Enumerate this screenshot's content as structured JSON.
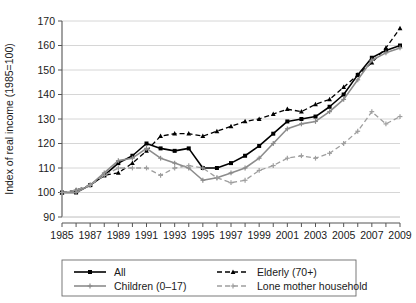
{
  "chart_data": {
    "type": "line",
    "title": "",
    "xlabel": "",
    "ylabel": "Index of real income (1985=100)",
    "xlim": [
      1985,
      2009
    ],
    "ylim": [
      90,
      170
    ],
    "ytick_step": 10,
    "xtick_step": 1,
    "xtick_label_step": 2,
    "grid": "horizontal",
    "legend_position": "bottom",
    "x": [
      1985,
      1986,
      1987,
      1988,
      1989,
      1990,
      1991,
      1992,
      1993,
      1994,
      1995,
      1996,
      1997,
      1998,
      1999,
      2000,
      2001,
      2002,
      2003,
      2004,
      2005,
      2006,
      2007,
      2008,
      2009
    ],
    "yticks": [
      90,
      100,
      110,
      120,
      130,
      140,
      150,
      160,
      170
    ],
    "xticks": [
      1985,
      1986,
      1987,
      1988,
      1989,
      1990,
      1991,
      1992,
      1993,
      1994,
      1995,
      1996,
      1997,
      1998,
      1999,
      2000,
      2001,
      2002,
      2003,
      2004,
      2005,
      2006,
      2007,
      2008,
      2009
    ],
    "xtick_labels": [
      "1985",
      "1987",
      "1989",
      "1991",
      "1993",
      "1995",
      "1997",
      "1999",
      "2001",
      "2003",
      "2005",
      "2007",
      "2009"
    ],
    "series": [
      {
        "name": "All",
        "color": "#000000",
        "style": "solid",
        "marker": "square",
        "values": [
          100,
          100,
          103,
          107,
          112,
          115,
          120,
          118,
          117,
          118,
          110,
          110,
          112,
          115,
          119,
          124,
          129,
          130,
          131,
          135,
          140,
          148,
          155,
          158,
          160
        ]
      },
      {
        "name": "Elderly (70+)",
        "color": "#000000",
        "style": "dashed",
        "marker": "triangle",
        "values": [
          100,
          101,
          103,
          107,
          108,
          112,
          117,
          123,
          124,
          124,
          123,
          125,
          127,
          129,
          130,
          132,
          134,
          133,
          136,
          138,
          143,
          148,
          153,
          159,
          167
        ]
      },
      {
        "name": "Children (0–17)",
        "color": "#8c8c8c",
        "style": "solid",
        "marker": "plus",
        "values": [
          100,
          100,
          103,
          108,
          113,
          114,
          118,
          114,
          112,
          110,
          105,
          106,
          108,
          110,
          114,
          120,
          126,
          128,
          129,
          133,
          138,
          146,
          154,
          157,
          159
        ]
      },
      {
        "name": "Lone mother household",
        "color": "#9e9e9e",
        "style": "dashed",
        "marker": "plus",
        "values": [
          100,
          101,
          103,
          107,
          110,
          110,
          110,
          107,
          110,
          111,
          110,
          106,
          104,
          105,
          109,
          111,
          114,
          115,
          114,
          116,
          120,
          125,
          133,
          128,
          131
        ]
      }
    ]
  },
  "legend": {
    "entries": [
      {
        "label": "All"
      },
      {
        "label": "Elderly (70+)"
      },
      {
        "label": "Children (0–17)"
      },
      {
        "label": "Lone mother household"
      }
    ]
  }
}
